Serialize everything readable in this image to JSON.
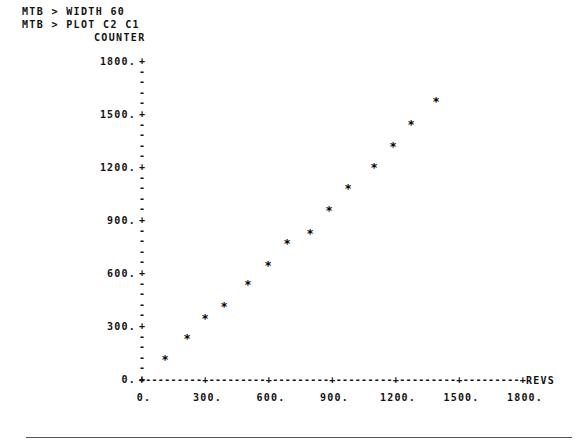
{
  "terminal": {
    "prompt_lines": [
      "MTB > WIDTH 60",
      "MTB > PLOT C2 C1"
    ]
  },
  "chart_data": {
    "type": "scatter",
    "title": "",
    "ylabel": "COUNTER",
    "xlabel": "REVS",
    "marker": "*",
    "xlim": [
      0,
      1800
    ],
    "ylim": [
      0,
      1800
    ],
    "grid": false,
    "legend": null,
    "xticks": [
      "0.",
      "300.",
      "600.",
      "900.",
      "1200.",
      "1500.",
      "1800."
    ],
    "xtick_values": [
      0,
      300,
      600,
      900,
      1200,
      1500,
      1800
    ],
    "yticks": [
      "1800.",
      "1500.",
      "1200.",
      "900.",
      "600.",
      "300.",
      "0."
    ],
    "ytick_values": [
      1800,
      1500,
      1200,
      900,
      600,
      300,
      0
    ],
    "minor_ticks_between_majors": 4,
    "axis_tick_glyph": "+",
    "axis_fill_glyph": "-",
    "x": [
      109,
      213,
      298,
      387,
      500,
      595,
      685,
      794,
      884,
      973,
      1096,
      1186,
      1271,
      1389
    ],
    "y": [
      130,
      249,
      362,
      430,
      555,
      662,
      787,
      843,
      973,
      1098,
      1217,
      1335,
      1460,
      1590
    ],
    "points": [
      {
        "x": 109,
        "y": 130
      },
      {
        "x": 213,
        "y": 249
      },
      {
        "x": 298,
        "y": 362
      },
      {
        "x": 387,
        "y": 430
      },
      {
        "x": 500,
        "y": 555
      },
      {
        "x": 595,
        "y": 662
      },
      {
        "x": 685,
        "y": 787
      },
      {
        "x": 794,
        "y": 843
      },
      {
        "x": 884,
        "y": 973
      },
      {
        "x": 973,
        "y": 1098
      },
      {
        "x": 1096,
        "y": 1217
      },
      {
        "x": 1186,
        "y": 1335
      },
      {
        "x": 1271,
        "y": 1460
      },
      {
        "x": 1389,
        "y": 1590
      }
    ]
  },
  "colors": {
    "background": "#ffffff",
    "ink": "#111111",
    "rule": "#555555"
  }
}
